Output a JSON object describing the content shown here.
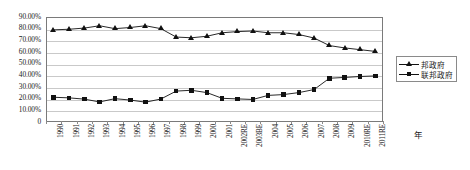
{
  "chart_data": {
    "type": "line",
    "title": "",
    "xlabel": "年",
    "ylabel": "",
    "ylim": [
      0,
      0.9
    ],
    "grid": true,
    "legend_position": "right",
    "ytick_labels": [
      "90.00%",
      "80.00%",
      "70.00%",
      "60.00%",
      "50.00%",
      "40.00%",
      "30.00%",
      "20.00%",
      "10.00%",
      "0"
    ],
    "ytick_values": [
      0.9,
      0.8,
      0.7,
      0.6,
      0.5,
      0.4,
      0.3,
      0.2,
      0.1,
      0
    ],
    "categories": [
      "1990",
      "1991",
      "1992",
      "1993",
      "1994",
      "1995",
      "1996",
      "1997",
      "1998",
      "1999",
      "2000",
      "2001",
      "2002RE",
      "2003BE",
      "2004",
      "2005",
      "2006",
      "2007",
      "2008",
      "2009",
      "2010RE",
      "2011RE"
    ],
    "series": [
      {
        "name": "邦政府",
        "marker": "triangle",
        "color": "#111111",
        "values": [
          0.79,
          0.795,
          0.805,
          0.825,
          0.8,
          0.81,
          0.825,
          0.8,
          0.728,
          0.722,
          0.735,
          0.765,
          0.775,
          0.78,
          0.765,
          0.765,
          0.75,
          0.72,
          0.655,
          0.635,
          0.62,
          0.605
        ]
      },
      {
        "name": "联邦政府",
        "marker": "square",
        "color": "#111111",
        "values": [
          0.212,
          0.207,
          0.196,
          0.172,
          0.2,
          0.188,
          0.17,
          0.197,
          0.265,
          0.272,
          0.252,
          0.203,
          0.198,
          0.193,
          0.228,
          0.235,
          0.252,
          0.278,
          0.375,
          0.382,
          0.39,
          0.395
        ]
      }
    ]
  },
  "legend": {
    "items": [
      {
        "label": "邦政府",
        "marker": "triangle"
      },
      {
        "label": "联邦政府",
        "marker": "square"
      }
    ]
  }
}
